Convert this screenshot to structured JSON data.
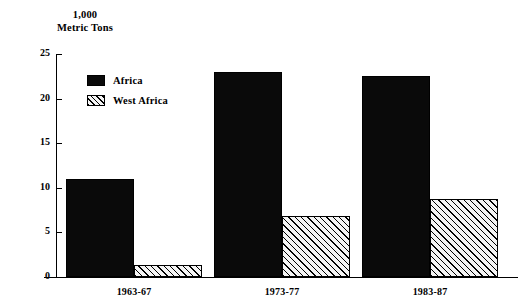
{
  "chart_data": {
    "type": "bar",
    "title": "",
    "ylabel_lines": [
      "1,000",
      "Metric Tons"
    ],
    "xlabel": "",
    "categories": [
      "1963-67",
      "1973-77",
      "1983-87"
    ],
    "series": [
      {
        "name": "Africa",
        "pattern": "solid",
        "values": [
          11.0,
          23.0,
          22.5
        ]
      },
      {
        "name": "West Africa",
        "pattern": "hatched",
        "values": [
          1.3,
          6.8,
          8.8
        ]
      }
    ],
    "ylim": [
      0,
      25
    ],
    "yticks": [
      0,
      5,
      10,
      15,
      20,
      25
    ],
    "ytick_labels": [
      "0",
      "5",
      "10",
      "15",
      "20",
      "25"
    ],
    "grid": false,
    "legend_position": "upper-left-inside"
  },
  "legend": {
    "entries": [
      {
        "label": "Africa"
      },
      {
        "label": "West Africa"
      }
    ]
  },
  "colors": {
    "series_africa": "#0a0a0a",
    "series_west_africa": "#f2f2f2",
    "axis": "#000000",
    "background": "#ffffff"
  }
}
